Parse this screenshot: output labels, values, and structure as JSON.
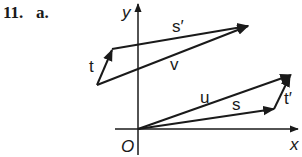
{
  "problem": {
    "number": "11.",
    "part": "a."
  },
  "axes": {
    "x_label": "x",
    "y_label": "y",
    "origin_label": "O"
  },
  "vectors": [
    {
      "name": "s'",
      "label": "s′",
      "from": [
        112,
        49
      ],
      "to": [
        248,
        26
      ]
    },
    {
      "name": "t",
      "label": "t",
      "from": [
        97,
        85
      ],
      "to": [
        112,
        49
      ]
    },
    {
      "name": "v",
      "label": "v",
      "from": [
        97,
        85
      ],
      "to": [
        248,
        26
      ]
    },
    {
      "name": "u",
      "label": "u",
      "from": [
        138,
        129
      ],
      "to": [
        291,
        75
      ]
    },
    {
      "name": "s",
      "label": "s",
      "from": [
        138,
        129
      ],
      "to": [
        274,
        109
      ]
    },
    {
      "name": "t'",
      "label": "t′",
      "from": [
        274,
        109
      ],
      "to": [
        291,
        75
      ]
    }
  ],
  "colors": {
    "ink": "#1a1a1a"
  }
}
